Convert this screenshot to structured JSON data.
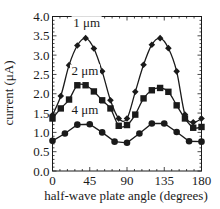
{
  "chart_data": {
    "type": "line",
    "title": "",
    "xlabel": "half-wave plate angle (degrees)",
    "ylabel": "current (μA)",
    "xlim": [
      0,
      180
    ],
    "ylim": [
      0.0,
      4.0
    ],
    "xticks": [
      0,
      45,
      90,
      135,
      180
    ],
    "xtick_labels": [
      "0",
      "45",
      "90",
      "135",
      "180"
    ],
    "yticks": [
      0.0,
      0.5,
      1.0,
      1.5,
      2.0,
      2.5,
      3.0,
      3.5,
      4.0
    ],
    "ytick_labels": [
      "0.0",
      "0.5",
      "1.0",
      "1.5",
      "2.0",
      "2.5",
      "3.0",
      "3.5",
      "4.0"
    ],
    "grid": false,
    "legend": "inline labels",
    "series": [
      {
        "name": "1 μm",
        "marker": "diamond",
        "fit": "smooth-curve",
        "label_pos": [
          40,
          3.75
        ],
        "x": [
          0,
          10,
          20,
          30,
          40,
          50,
          60,
          70,
          80,
          90,
          100,
          110,
          120,
          130,
          140,
          150,
          160,
          170,
          180
        ],
        "values": [
          1.45,
          1.94,
          2.74,
          3.25,
          3.44,
          3.17,
          2.58,
          1.83,
          1.36,
          1.36,
          2.05,
          2.75,
          3.27,
          3.44,
          3.18,
          2.58,
          1.46,
          1.26,
          1.36
        ]
      },
      {
        "name": "2 μm",
        "marker": "square",
        "fit": "smooth-curve",
        "label_pos": [
          38,
          2.5
        ],
        "x": [
          0,
          10,
          20,
          30,
          40,
          50,
          60,
          70,
          80,
          90,
          100,
          110,
          120,
          130,
          140,
          150,
          160,
          170,
          180
        ],
        "values": [
          1.36,
          1.62,
          1.85,
          2.22,
          2.22,
          2.06,
          1.83,
          1.62,
          1.17,
          1.19,
          1.46,
          1.88,
          2.09,
          2.15,
          2.05,
          1.7,
          1.36,
          1.12,
          1.14
        ]
      },
      {
        "name": "4 μm",
        "marker": "circle",
        "fit": "line-through-points",
        "label_pos": [
          38,
          1.5
        ],
        "x": [
          0,
          15,
          30,
          45,
          60,
          75,
          90,
          105,
          120,
          135,
          150,
          165,
          180
        ],
        "values": [
          0.78,
          0.97,
          1.2,
          1.21,
          1.0,
          0.76,
          0.73,
          0.97,
          1.23,
          1.23,
          1.01,
          0.77,
          0.76
        ]
      }
    ]
  }
}
